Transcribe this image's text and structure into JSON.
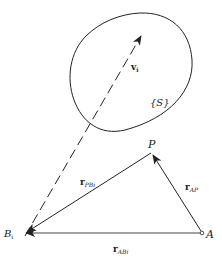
{
  "diagram": {
    "region_label": "{S}",
    "velocity": {
      "base": "v",
      "sub": "i"
    },
    "points": {
      "P": "P",
      "A": "A",
      "B": {
        "base": "B",
        "sub": "i"
      }
    },
    "vectors": {
      "r_PB": {
        "base": "r",
        "sub": "PBi"
      },
      "r_AP": {
        "base": "r",
        "sub": "AP"
      },
      "r_AB": {
        "base": "r",
        "sub": "ABi"
      }
    },
    "colors": {
      "stroke": "#222222",
      "background": "#ffffff"
    }
  }
}
